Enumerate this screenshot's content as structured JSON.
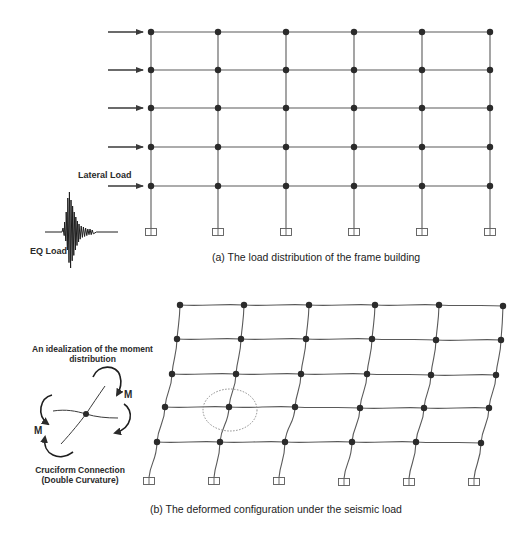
{
  "figure_a": {
    "caption": "(a) The load distribution of the frame building",
    "lateral_load_label": "Lateral Load",
    "eq_load_label": "EQ Load",
    "columns_x": [
      151,
      218,
      286,
      354,
      422,
      490
    ],
    "floors_y": [
      32,
      70,
      108,
      147,
      186
    ],
    "support_y": 232,
    "arrows": {
      "x_start": 108,
      "x_end": 143,
      "count": 5
    }
  },
  "figure_b": {
    "caption": "(b) The deformed configuration under the seismic load",
    "moment_title_line1": "An idealization of the moment",
    "moment_title_line2": "distribution",
    "moment_label_right": "M",
    "moment_label_left": "M",
    "connection_label_line1": "Cruciform Connection",
    "connection_label_line2": "(Double Curvature)",
    "columns": [
      {
        "nodes": [
          [
            180,
            305
          ],
          [
            177,
            339
          ],
          [
            172,
            374
          ],
          [
            165,
            407
          ],
          [
            157,
            442
          ]
        ],
        "base": [
          149,
          481
        ]
      },
      {
        "nodes": [
          [
            244,
            305
          ],
          [
            241,
            339
          ],
          [
            236,
            374
          ],
          [
            229,
            407
          ],
          [
            220,
            442
          ]
        ],
        "base": [
          214,
          481
        ]
      },
      {
        "nodes": [
          [
            309,
            305
          ],
          [
            306,
            339
          ],
          [
            301,
            374
          ],
          [
            295,
            407
          ],
          [
            285,
            442
          ]
        ],
        "base": [
          279,
          481
        ]
      },
      {
        "nodes": [
          [
            375,
            305
          ],
          [
            372,
            339
          ],
          [
            367,
            374
          ],
          [
            360,
            408
          ],
          [
            352,
            442
          ]
        ],
        "base": [
          344,
          482
        ]
      },
      {
        "nodes": [
          [
            439,
            305
          ],
          [
            436,
            340
          ],
          [
            431,
            375
          ],
          [
            424,
            408
          ],
          [
            416,
            442
          ]
        ],
        "base": [
          409,
          482
        ]
      },
      {
        "nodes": [
          [
            503,
            306
          ],
          [
            501,
            340
          ],
          [
            496,
            375
          ],
          [
            489,
            408
          ],
          [
            481,
            443
          ]
        ],
        "base": [
          474,
          482
        ]
      }
    ],
    "highlight_circle": {
      "cx": 230,
      "cy": 410,
      "rx": 27,
      "ry": 21
    }
  },
  "colors": {
    "line": "#5a5a5a",
    "node": "#2b2b2b",
    "text": "#2a2a2a",
    "dotted": "#8a8a8a"
  }
}
